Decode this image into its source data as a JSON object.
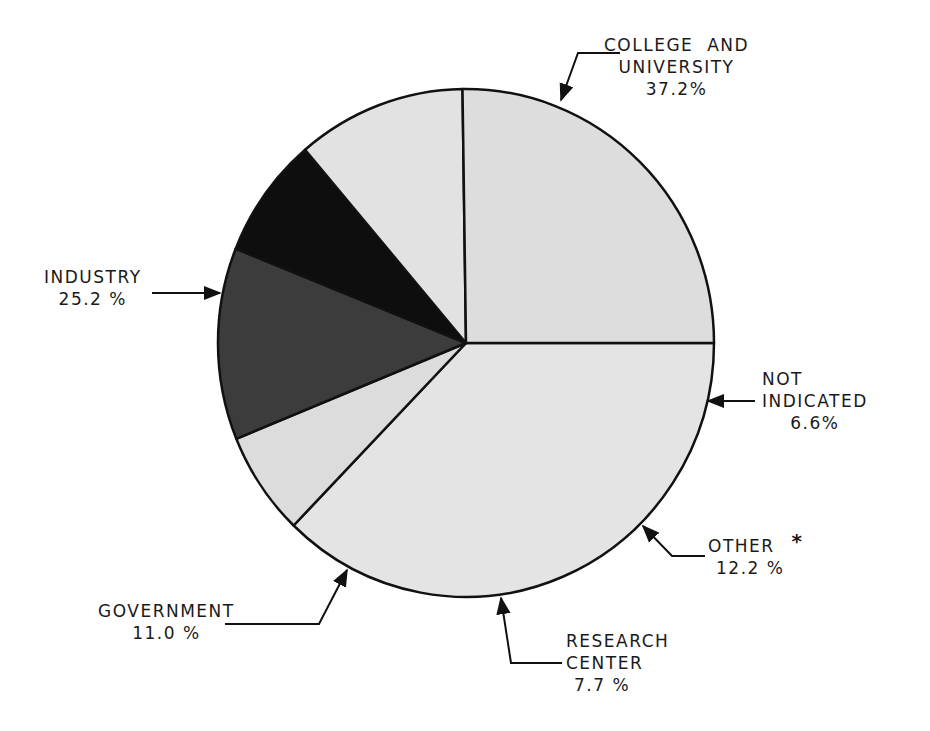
{
  "chart_data": {
    "type": "pie",
    "title": "",
    "unit": "%",
    "categories": [
      "College and University",
      "Not Indicated",
      "Other *",
      "Research Center",
      "Government",
      "Industry"
    ],
    "values": [
      37.2,
      6.6,
      12.2,
      7.7,
      11.0,
      25.2
    ],
    "colors": [
      "#e4e4e4",
      "#dcdcdc",
      "#3c3c3c",
      "#0e0e0e",
      "#e2e2e2",
      "#dddddd"
    ],
    "legend": "none (direct labels with arrows)",
    "start_angle_deg": 0,
    "direction": "clockwise from 3 o'clock"
  },
  "labels": {
    "college": {
      "line1": "COLLEGE  AND",
      "line2": "UNIVERSITY",
      "pct": "37.2%"
    },
    "industry": {
      "line1": "INDUSTRY",
      "pct": "25.2 %"
    },
    "not_indicated": {
      "line1": "NOT",
      "line2": "INDICATED",
      "pct": "6.6%"
    },
    "other": {
      "line1": "OTHER",
      "asterisk": "*",
      "pct": "12.2 %"
    },
    "government": {
      "line1": "GOVERNMENT",
      "pct": "11.0 %"
    },
    "research": {
      "line1": "RESEARCH",
      "line2": "CENTER",
      "pct": "7.7 %"
    }
  }
}
